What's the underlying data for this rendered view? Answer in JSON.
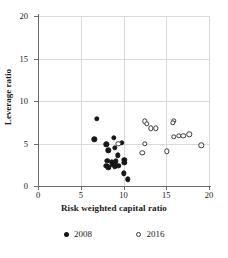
{
  "chart_data": {
    "type": "scatter",
    "title": "",
    "xlabel": "Risk weighted capital ratio",
    "ylabel": "Leverage ratio",
    "xlim": [
      0,
      20
    ],
    "ylim": [
      0,
      20
    ],
    "xticks": [
      0,
      5,
      10,
      15,
      20
    ],
    "yticks": [
      0,
      5,
      10,
      15,
      20
    ],
    "xticklabels": [
      "0",
      "5",
      "10",
      "15",
      "20"
    ],
    "yticklabels": [
      "0",
      "5",
      "10",
      "15",
      "20"
    ],
    "grid": true,
    "legend_position": "bottom",
    "series": [
      {
        "name": "2008",
        "marker": "filled-circle",
        "color": "#161616",
        "points": [
          {
            "x": 6.9,
            "y": 7.9
          },
          {
            "x": 6.6,
            "y": 5.5
          },
          {
            "x": 8.0,
            "y": 4.9
          },
          {
            "x": 8.2,
            "y": 4.2
          },
          {
            "x": 8.9,
            "y": 5.7
          },
          {
            "x": 9.0,
            "y": 4.5
          },
          {
            "x": 9.3,
            "y": 3.6
          },
          {
            "x": 9.8,
            "y": 5.1
          },
          {
            "x": 8.1,
            "y": 3.0
          },
          {
            "x": 8.0,
            "y": 2.4
          },
          {
            "x": 8.2,
            "y": 2.2
          },
          {
            "x": 8.6,
            "y": 2.8
          },
          {
            "x": 8.8,
            "y": 2.5
          },
          {
            "x": 9.1,
            "y": 2.9
          },
          {
            "x": 9.0,
            "y": 2.3
          },
          {
            "x": 9.4,
            "y": 2.4
          },
          {
            "x": 10.1,
            "y": 3.1
          },
          {
            "x": 10.1,
            "y": 2.7
          },
          {
            "x": 10.0,
            "y": 1.5
          },
          {
            "x": 10.5,
            "y": 0.8
          }
        ]
      },
      {
        "name": "2016",
        "marker": "open-circle",
        "color": "#3a3a3a",
        "points": [
          {
            "x": 9.4,
            "y": 5.0
          },
          {
            "x": 12.5,
            "y": 7.6
          },
          {
            "x": 12.7,
            "y": 7.3
          },
          {
            "x": 13.2,
            "y": 6.8
          },
          {
            "x": 13.8,
            "y": 6.8
          },
          {
            "x": 12.5,
            "y": 5.0
          },
          {
            "x": 12.2,
            "y": 3.9
          },
          {
            "x": 15.9,
            "y": 7.7
          },
          {
            "x": 15.8,
            "y": 7.4
          },
          {
            "x": 15.9,
            "y": 5.8
          },
          {
            "x": 16.5,
            "y": 5.9
          },
          {
            "x": 17.0,
            "y": 5.9
          },
          {
            "x": 17.7,
            "y": 6.1
          },
          {
            "x": 15.1,
            "y": 4.1
          },
          {
            "x": 19.1,
            "y": 4.8
          }
        ]
      }
    ]
  },
  "legend": {
    "items": [
      {
        "label": "2008",
        "marker": "filled-circle"
      },
      {
        "label": "2016",
        "marker": "open-circle"
      }
    ]
  }
}
